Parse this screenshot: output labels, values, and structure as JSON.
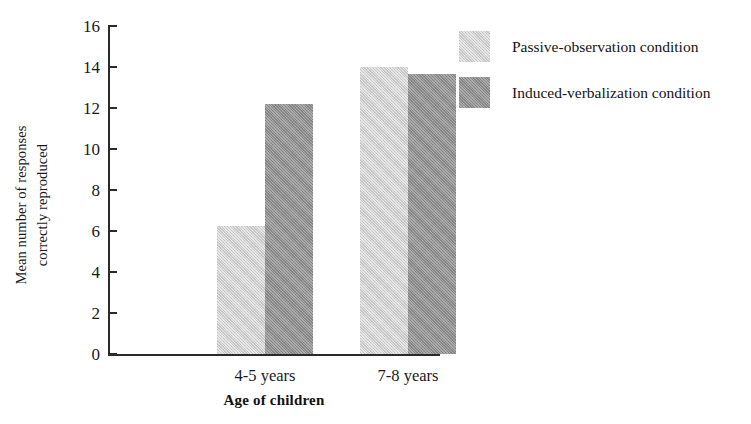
{
  "chart_data": {
    "type": "bar",
    "title": "",
    "subtitle": "",
    "xlabel": "Age of children",
    "ylabel": "Mean number of responses correctly reproduced",
    "ylabel_lines": [
      "Mean number of responses",
      "correctly reproduced"
    ],
    "categories": [
      "4-5 years",
      "7-8 years"
    ],
    "series": [
      {
        "name": "Passive-observation condition",
        "color": "#cdcdcd",
        "values": [
          6.25,
          14.0
        ]
      },
      {
        "name": "Induced-verbalization condition",
        "color": "#8d8d8d",
        "values": [
          12.2,
          13.65
        ]
      }
    ],
    "ylim": [
      0,
      16
    ],
    "ytick_values": [
      0,
      2,
      4,
      6,
      8,
      10,
      12,
      14,
      16
    ],
    "ytick_labels": [
      "0",
      "2",
      "4",
      "6",
      "8",
      "10",
      "12",
      "14",
      "16"
    ],
    "grid": false,
    "legend_position": "right",
    "axis_color": "#2b2b2b",
    "background": "#ffffff"
  },
  "legend": {
    "entries": [
      {
        "label": "Passive-observation condition",
        "swatch": "light"
      },
      {
        "label": "Induced-verbalization condition",
        "swatch": "dark"
      }
    ]
  }
}
